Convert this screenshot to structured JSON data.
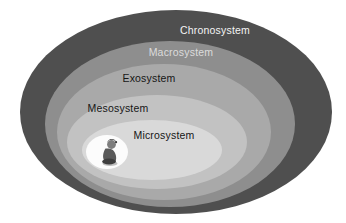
{
  "diagram": {
    "type": "nested-ellipses",
    "background": "#ffffff",
    "layers": [
      {
        "id": "chronosystem",
        "label": "Chronosystem",
        "fill": "#4f4f4f",
        "label_color": "#f4f4f4"
      },
      {
        "id": "macrosystem",
        "label": "Macrosystem",
        "fill": "#8e8e8e",
        "label_color": "#dcdcdc"
      },
      {
        "id": "exosystem",
        "label": "Exosystem",
        "fill": "#a9a9a9",
        "label_color": "#161616"
      },
      {
        "id": "mesosystem",
        "label": "Mesosystem",
        "fill": "#c2c2c2",
        "label_color": "#161616"
      },
      {
        "id": "microsystem",
        "label": "Microsystem",
        "fill": "#d9d9d9",
        "label_color": "#161616"
      }
    ],
    "center": {
      "icon": "child-icon",
      "spot_color": "#fcfcfc",
      "figure_dark": "#3e3e3e",
      "figure_mid": "#5a5a5a",
      "figure_light": "#7d7d7d"
    }
  }
}
